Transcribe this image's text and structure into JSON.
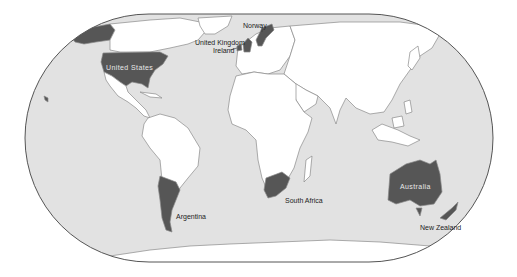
{
  "map": {
    "projection": "world",
    "colors": {
      "ocean": "#e2e2e2",
      "land": "#ffffff",
      "border": "#8a8a8a",
      "highlight": "#565656",
      "outline": "#555555",
      "label_dark": "#222222",
      "label_light": "#e8e8e8"
    },
    "highlighted_countries": [
      "United States",
      "United Kingdom",
      "Ireland",
      "Norway",
      "Argentina",
      "South Africa",
      "Australia",
      "New Zealand"
    ],
    "labels": {
      "norway": "Norway",
      "uk": "United Kingdom",
      "ireland": "Ireland",
      "us": "United States",
      "argentina": "Argentina",
      "south_africa": "South Africa",
      "australia": "Australia",
      "new_zealand": "New Zealand"
    }
  }
}
